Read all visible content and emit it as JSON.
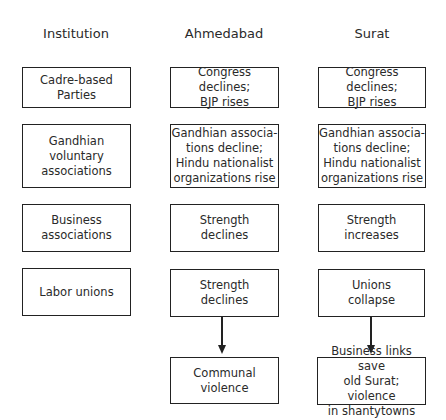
{
  "headers": {
    "institution": "Institution",
    "ahmedabad": "Ahmedabad",
    "surat": "Surat"
  },
  "rows": [
    {
      "institution": [
        "Cadre-based",
        "Parties"
      ],
      "ahmedabad": [
        "Congress declines;",
        "BJP rises"
      ],
      "surat": [
        "Congress declines;",
        "BJP rises"
      ]
    },
    {
      "institution": [
        "Gandhian",
        "voluntary",
        "associations"
      ],
      "ahmedabad": [
        "Gandhian associa-",
        "tions decline;",
        "Hindu nationalist",
        "organizations rise"
      ],
      "surat": [
        "Gandhian associa-",
        "tions decline;",
        "Hindu nationalist",
        "organizations rise"
      ]
    },
    {
      "institution": [
        "Business",
        "associations"
      ],
      "ahmedabad": [
        "Strength",
        "declines"
      ],
      "surat": [
        "Strength",
        "increases"
      ]
    },
    {
      "institution": [
        "Labor unions"
      ],
      "ahmedabad": [
        "Strength",
        "declines"
      ],
      "surat": [
        "Unions",
        "collapse"
      ]
    }
  ],
  "outcomes": {
    "ahmedabad": [
      "Communal",
      "violence"
    ],
    "surat": [
      "Business links save",
      "old Surat; violence",
      "in shantytowns"
    ]
  },
  "colors": {
    "border": "#222222",
    "text": "#2a2a2a",
    "background": "#ffffff"
  }
}
